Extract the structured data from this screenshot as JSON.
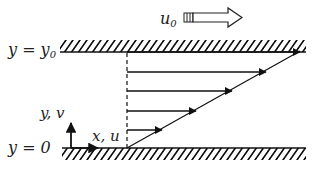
{
  "diagram": {
    "labels": {
      "top_wall": "y = y",
      "top_wall_sub": "0",
      "bottom_wall": "y = 0",
      "axis_vertical": "y, v",
      "axis_horizontal": "x, u",
      "plate_velocity": "u",
      "plate_velocity_sub": "0"
    },
    "profile": {
      "arrow_count": 5,
      "shape": "linear"
    },
    "colors": {
      "line": "#111111",
      "background": "#ffffff"
    }
  }
}
